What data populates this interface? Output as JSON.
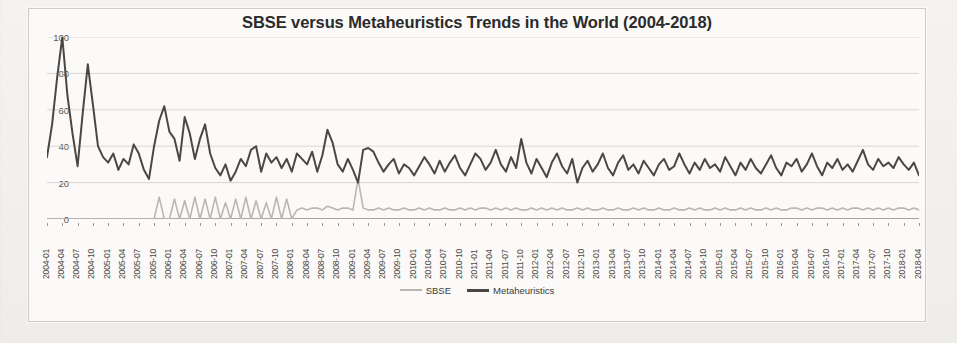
{
  "chart_data": {
    "type": "line",
    "title": "SBSE versus Metaheuristics Trends in the World (2004-2018)",
    "xlabel": "",
    "ylabel": "",
    "ylim": [
      0,
      100
    ],
    "yticks": [
      0,
      20,
      40,
      60,
      80,
      100
    ],
    "grid": true,
    "legend_position": "bottom",
    "x_tick_step_months": 3,
    "x_start": "2004-01",
    "x_end": "2018-04",
    "x_tick_labels": [
      "2004-01",
      "2004-04",
      "2004-07",
      "2004-10",
      "2005-01",
      "2005-04",
      "2005-07",
      "2005-10",
      "2006-01",
      "2006-04",
      "2006-07",
      "2006-10",
      "2007-01",
      "2007-04",
      "2007-07",
      "2007-10",
      "2008-01",
      "2008-04",
      "2008-07",
      "2008-10",
      "2009-01",
      "2009-04",
      "2009-07",
      "2009-10",
      "2010-01",
      "2010-04",
      "2010-07",
      "2010-10",
      "2011-01",
      "2011-04",
      "2011-07",
      "2011-10",
      "2012-01",
      "2012-04",
      "2012-07",
      "2012-10",
      "2013-01",
      "2013-04",
      "2013-07",
      "2013-10",
      "2014-01",
      "2014-04",
      "2014-07",
      "2014-10",
      "2015-01",
      "2015-04",
      "2015-07",
      "2015-10",
      "2016-01",
      "2016-04",
      "2016-07",
      "2016-10",
      "2017-01",
      "2017-04",
      "2017-07",
      "2017-10",
      "2018-01",
      "2018-04"
    ],
    "series": [
      {
        "name": "SBSE",
        "color": "#b9b7b3",
        "values": [
          0,
          0,
          0,
          0,
          0,
          0,
          0,
          0,
          0,
          0,
          0,
          0,
          0,
          0,
          0,
          0,
          0,
          0,
          0,
          0,
          0,
          0,
          12,
          0,
          0,
          11,
          0,
          10,
          0,
          12,
          0,
          11,
          0,
          12,
          0,
          9,
          0,
          11,
          0,
          12,
          0,
          10,
          0,
          9,
          0,
          12,
          0,
          11,
          0,
          5,
          6,
          5,
          6,
          6,
          5,
          7,
          6,
          5,
          6,
          6,
          5,
          22,
          6,
          5,
          5,
          6,
          5,
          6,
          5,
          5,
          6,
          5,
          5,
          6,
          5,
          6,
          5,
          5,
          6,
          5,
          5,
          6,
          5,
          6,
          5,
          6,
          6,
          5,
          6,
          5,
          6,
          5,
          6,
          5,
          5,
          6,
          5,
          6,
          5,
          6,
          5,
          6,
          5,
          5,
          6,
          5,
          6,
          5,
          5,
          6,
          5,
          5,
          6,
          5,
          5,
          6,
          5,
          6,
          5,
          5,
          6,
          5,
          5,
          6,
          5,
          5,
          6,
          5,
          6,
          5,
          5,
          6,
          5,
          6,
          5,
          5,
          6,
          5,
          6,
          5,
          5,
          6,
          5,
          6,
          5,
          5,
          6,
          6,
          5,
          6,
          5,
          6,
          6,
          5,
          6,
          5,
          6,
          5,
          6,
          6,
          5,
          6,
          5,
          6,
          5,
          6,
          5,
          6,
          6,
          5,
          6,
          5
        ]
      },
      {
        "name": "Metaheuristics",
        "color": "#4a4845",
        "values": [
          34,
          52,
          78,
          100,
          68,
          47,
          29,
          58,
          85,
          63,
          40,
          34,
          31,
          36,
          27,
          33,
          30,
          41,
          36,
          27,
          22,
          40,
          54,
          62,
          48,
          44,
          32,
          56,
          47,
          33,
          44,
          52,
          36,
          28,
          24,
          30,
          21,
          26,
          33,
          29,
          38,
          40,
          26,
          36,
          31,
          34,
          28,
          33,
          26,
          36,
          33,
          30,
          37,
          26,
          35,
          49,
          42,
          30,
          26,
          33,
          27,
          20,
          38,
          39,
          37,
          31,
          26,
          30,
          33,
          25,
          30,
          28,
          24,
          29,
          34,
          30,
          25,
          32,
          26,
          31,
          35,
          28,
          24,
          30,
          36,
          33,
          27,
          31,
          38,
          30,
          26,
          34,
          28,
          44,
          31,
          25,
          33,
          28,
          23,
          31,
          36,
          29,
          25,
          33,
          20,
          28,
          32,
          26,
          30,
          36,
          28,
          24,
          31,
          35,
          27,
          30,
          25,
          32,
          28,
          24,
          30,
          33,
          27,
          29,
          36,
          30,
          25,
          31,
          27,
          33,
          28,
          30,
          26,
          34,
          29,
          24,
          31,
          27,
          33,
          28,
          25,
          30,
          35,
          28,
          24,
          31,
          29,
          33,
          26,
          30,
          36,
          29,
          24,
          31,
          28,
          33,
          27,
          30,
          26,
          32,
          38,
          30,
          27,
          33,
          29,
          31,
          28,
          34,
          30,
          27,
          31,
          24
        ]
      }
    ]
  },
  "legend": {
    "items": [
      {
        "label": "SBSE"
      },
      {
        "label": "Metaheuristics"
      }
    ]
  }
}
